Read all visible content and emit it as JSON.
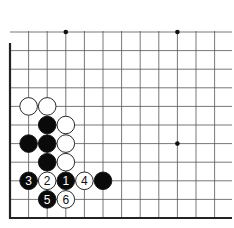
{
  "board": {
    "origin_x": 10,
    "origin_y": 218,
    "spacing": 18.6,
    "cols": 12,
    "rows": 11,
    "top_y": 32,
    "right_x": 232,
    "edges": [
      "left",
      "bottom"
    ],
    "star_points": [
      [
        3,
        10
      ],
      [
        9,
        10
      ],
      [
        9,
        4
      ]
    ],
    "line_color": "#555555",
    "edge_color": "#222222"
  },
  "stones": [
    {
      "color": "white",
      "col": 1,
      "row": 6
    },
    {
      "color": "white",
      "col": 2,
      "row": 6
    },
    {
      "color": "black",
      "col": 2,
      "row": 5
    },
    {
      "color": "white",
      "col": 3,
      "row": 5
    },
    {
      "color": "black",
      "col": 1,
      "row": 4
    },
    {
      "color": "black",
      "col": 2,
      "row": 4
    },
    {
      "color": "white",
      "col": 3,
      "row": 4
    },
    {
      "color": "black",
      "col": 2,
      "row": 3
    },
    {
      "color": "white",
      "col": 3,
      "row": 3
    },
    {
      "color": "black",
      "col": 1,
      "row": 2,
      "label": "3"
    },
    {
      "color": "white",
      "col": 2,
      "row": 2,
      "label": "2"
    },
    {
      "color": "black",
      "col": 3,
      "row": 2,
      "label": "1"
    },
    {
      "color": "white",
      "col": 4,
      "row": 2,
      "label": "4"
    },
    {
      "color": "black",
      "col": 5,
      "row": 2
    },
    {
      "color": "black",
      "col": 2,
      "row": 1,
      "label": "5"
    },
    {
      "color": "white",
      "col": 3,
      "row": 1,
      "label": "6"
    }
  ]
}
